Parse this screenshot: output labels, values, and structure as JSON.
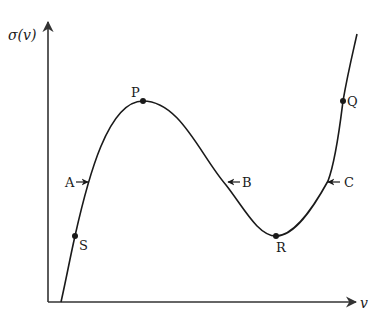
{
  "diagram": {
    "type": "function-curve",
    "colors": {
      "curve": "#1a1a1a",
      "axes": "#333333",
      "background": "#ffffff"
    },
    "y_axis": {
      "label": "σ(v)"
    },
    "x_axis": {
      "label": "v"
    },
    "points": [
      {
        "id": "S",
        "label": "S",
        "description": "point on rising branch near bottom"
      },
      {
        "id": "P",
        "label": "P",
        "description": "local maximum"
      },
      {
        "id": "R",
        "label": "R",
        "description": "local minimum"
      },
      {
        "id": "Q",
        "label": "Q",
        "description": "point on rising branch right, same height as P"
      }
    ],
    "annotations": [
      {
        "id": "A",
        "label": "A",
        "arrow": "right",
        "description": "arrow pointing right toward left rising branch"
      },
      {
        "id": "B",
        "label": "B",
        "arrow": "left",
        "description": "arrow pointing left toward descending branch"
      },
      {
        "id": "C",
        "label": "C",
        "arrow": "left",
        "description": "arrow pointing left toward right rising branch"
      }
    ]
  }
}
